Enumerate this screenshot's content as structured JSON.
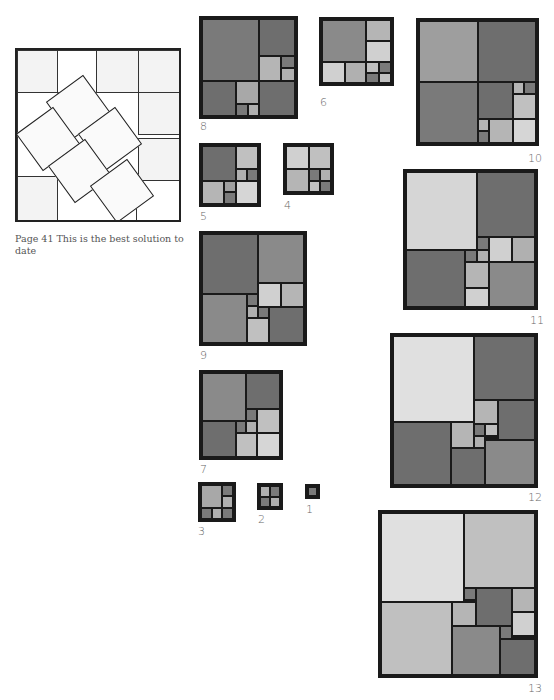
{
  "figure_41": {
    "caption": "Page 41 This is the best solution to date"
  },
  "colors": {
    "D": "#6e6e6e",
    "M": "#8a8a8a",
    "L": "#b5b5b5",
    "P": "#d6d6d6",
    "frame": "#1a1a1a"
  },
  "squares": [
    {
      "n": "8",
      "label": "8"
    },
    {
      "n": "6",
      "label": "6"
    },
    {
      "n": "10",
      "label": "10"
    },
    {
      "n": "5",
      "label": "5"
    },
    {
      "n": "4",
      "label": "4"
    },
    {
      "n": "11",
      "label": "11"
    },
    {
      "n": "9",
      "label": "9"
    },
    {
      "n": "12",
      "label": "12"
    },
    {
      "n": "7",
      "label": "7"
    },
    {
      "n": "3",
      "label": "3"
    },
    {
      "n": "2",
      "label": "2"
    },
    {
      "n": "1",
      "label": "1"
    },
    {
      "n": "13",
      "label": "13"
    }
  ]
}
